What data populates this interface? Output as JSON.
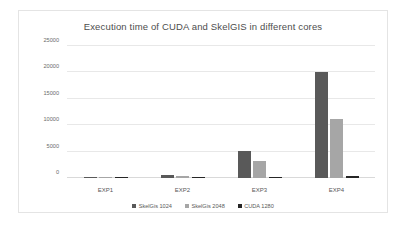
{
  "chart_data": {
    "type": "bar",
    "title": "Execution time of CUDA and SkelGIS in different cores",
    "xlabel": "",
    "ylabel": "",
    "categories": [
      "EXP1",
      "EXP2",
      "EXP3",
      "EXP4"
    ],
    "series": [
      {
        "name": "SkelGis 1024",
        "color": "#595959",
        "values": [
          150,
          620,
          5200,
          20000
        ]
      },
      {
        "name": "SkelGis 2048",
        "color": "#a6a6a6",
        "values": [
          60,
          300,
          3300,
          11200
        ]
      },
      {
        "name": "CUDA 1280",
        "color": "#262626",
        "values": [
          20,
          30,
          60,
          320
        ]
      }
    ],
    "ylim": [
      0,
      25000
    ],
    "yticks": [
      0,
      5000,
      10000,
      15000,
      20000,
      25000
    ],
    "ytick_labels": [
      "0",
      "5000",
      "10000",
      "15000",
      "20000",
      "25000"
    ],
    "grid": true,
    "legend_position": "bottom",
    "plot_background": "#ffffff",
    "gridline_color": "#e8e8e8",
    "border_color": "#e4e4e4"
  }
}
